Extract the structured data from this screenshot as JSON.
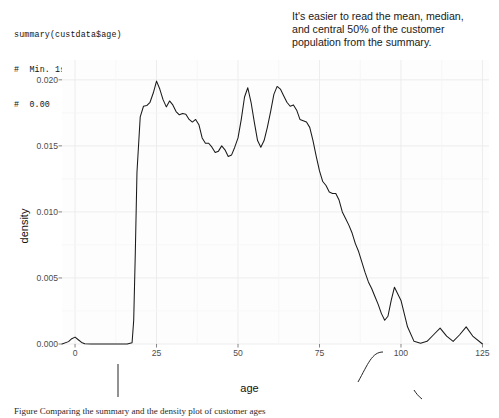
{
  "console": {
    "lines": [
      "summary(custdata$age)",
      "#  Min. 1st Qu.  Median    Mean 3rd Qu.     Max.",
      "#  0.00   34.00   48.00   49.16   62.00   120.00"
    ],
    "command": "summary(custdata$age)",
    "stats": {
      "Min.": "0.00",
      "1st Qu.": "34.00",
      "Median": "48.00",
      "Mean": "49.16",
      "3rd Qu.": "62.00",
      "Max.": "120.00"
    }
  },
  "annotations": {
    "summary_note": [
      "It's easier to read the mean, median,",
      "and central 50% of the customer",
      "population from the summary."
    ],
    "range_note": [
      "It's easier to get a sense of",
      "the customer age range",
      "from the graph."
    ],
    "blip_note": [
      "Curious blip",
      "around 90. Data",
      "input problem?"
    ],
    "invalid_note": [
      "Invalid",
      "values?"
    ],
    "outliers_note": [
      "Outliers"
    ]
  },
  "caption": "Figure  Comparing the summary and the density plot of customer ages",
  "colors": {
    "line": "#1a1a1a",
    "panel": "#fdfdfd",
    "grid": "#ebebeb",
    "tick_text": "#4d4d4d",
    "axis_text": "#111111"
  },
  "chart_data": {
    "type": "line",
    "title": "",
    "xlabel": "age",
    "ylabel": "density",
    "xlim": [
      -4,
      127
    ],
    "ylim": [
      0,
      0.0215
    ],
    "xticks": [
      0,
      25,
      50,
      75,
      100,
      125
    ],
    "yticks": [
      0.0,
      0.005,
      0.01,
      0.015,
      0.02
    ],
    "ytick_labels": [
      "0.000",
      "0.005",
      "0.010",
      "0.015",
      "0.020"
    ],
    "xtick_labels": [
      "0",
      "25",
      "50",
      "75",
      "100",
      "125"
    ],
    "grid": true,
    "legend": "none",
    "series": [
      {
        "name": "age density",
        "x": [
          -4,
          -2,
          -1,
          0,
          1,
          2,
          3,
          5,
          8,
          12,
          16,
          17.5,
          18,
          18.5,
          19,
          20,
          21,
          22,
          23,
          24,
          25,
          26,
          27,
          28,
          29,
          30,
          31,
          32,
          33,
          34,
          35,
          36,
          37,
          38,
          39,
          40,
          41,
          42,
          43,
          44,
          45,
          46,
          47,
          48,
          49,
          50,
          51,
          52,
          53,
          54,
          55,
          56,
          57,
          58,
          59,
          60,
          61,
          62,
          63,
          64,
          65,
          66,
          67,
          68,
          69,
          70,
          71,
          72,
          73,
          74,
          75,
          76,
          77,
          78,
          79,
          80,
          81,
          82,
          83,
          84,
          85,
          86,
          87,
          88,
          89,
          90,
          91,
          92,
          93,
          94,
          95,
          96,
          97,
          98,
          100,
          102,
          104,
          106,
          108,
          110,
          112,
          114,
          116,
          118,
          120,
          122,
          125
        ],
        "y": [
          0.0,
          0.00018,
          0.0004,
          0.00052,
          0.00032,
          0.00012,
          2e-05,
          0.0,
          0.0,
          0.0,
          0.0,
          0.0001,
          0.0018,
          0.007,
          0.013,
          0.0172,
          0.018,
          0.01805,
          0.0183,
          0.019,
          0.0199,
          0.0193,
          0.0185,
          0.01795,
          0.0184,
          0.0181,
          0.0176,
          0.01735,
          0.01745,
          0.0174,
          0.017,
          0.0168,
          0.017,
          0.0166,
          0.0156,
          0.0152,
          0.0152,
          0.0149,
          0.0145,
          0.0146,
          0.015,
          0.0147,
          0.0142,
          0.0143,
          0.0149,
          0.0156,
          0.017,
          0.0187,
          0.0194,
          0.0183,
          0.0168,
          0.0154,
          0.0149,
          0.0154,
          0.0164,
          0.0176,
          0.0189,
          0.0195,
          0.0193,
          0.0188,
          0.0183,
          0.018,
          0.0181,
          0.0177,
          0.017,
          0.0169,
          0.0168,
          0.0164,
          0.0154,
          0.0142,
          0.0131,
          0.0123,
          0.012,
          0.0115,
          0.0114,
          0.0114,
          0.0109,
          0.01,
          0.0095,
          0.009,
          0.0084,
          0.0076,
          0.007,
          0.0062,
          0.0054,
          0.0047,
          0.0042,
          0.0036,
          0.003,
          0.0023,
          0.0018,
          0.0021,
          0.0033,
          0.0043,
          0.0033,
          0.0013,
          0.0002,
          5e-05,
          0.0002,
          0.0007,
          0.0012,
          0.0006,
          0.0002,
          0.0007,
          0.0013,
          0.0006,
          0.0
        ]
      }
    ],
    "features": [
      {
        "label": "Invalid values?",
        "x": 0,
        "note": "spike at age 0"
      },
      {
        "label": "Curious blip around 90. Data input problem?",
        "x": 90
      },
      {
        "label": "Outliers",
        "x": 112
      }
    ]
  }
}
